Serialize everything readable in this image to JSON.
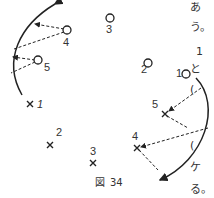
{
  "figure": {
    "caption_prefix": "図",
    "caption_number": "34",
    "circles": [
      {
        "label": "1",
        "x": 186,
        "y": 74
      },
      {
        "label": "2",
        "x": 148,
        "y": 63
      },
      {
        "label": "3",
        "x": 110,
        "y": 18
      },
      {
        "label": "4",
        "x": 67,
        "y": 30
      },
      {
        "label": "5",
        "x": 38,
        "y": 60
      }
    ],
    "crosses": [
      {
        "label": "1",
        "x": 30,
        "y": 104
      },
      {
        "label": "2",
        "x": 50,
        "y": 145
      },
      {
        "label": "3",
        "x": 93,
        "y": 163
      },
      {
        "label": "4",
        "x": 137,
        "y": 148
      },
      {
        "label": "5",
        "x": 165,
        "y": 114
      }
    ]
  },
  "side_text": {
    "line1": "あ",
    "line2": "う。",
    "line3": "1",
    "line4": "と",
    "line5": "(",
    "line6": "(",
    "line7": "ケ",
    "line8": "る。"
  }
}
